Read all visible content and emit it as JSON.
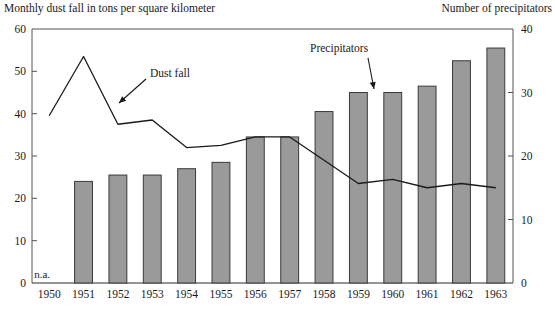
{
  "header": {
    "left_title": "Monthly dust fall in tons per square kilometer",
    "right_title": "Number of precipitators"
  },
  "annotations": {
    "dust_fall_label": "Dust fall",
    "precipitators_label": "Precipitators",
    "not_available_label": "n.a."
  },
  "axes": {
    "left_ticks": [
      "60",
      "50",
      "40",
      "30",
      "20",
      "10",
      "0"
    ],
    "right_ticks": [
      "40",
      "30",
      "20",
      "10",
      "0"
    ],
    "year_labels": [
      "1950",
      "1951",
      "1952",
      "1953",
      "1954",
      "1955",
      "1956",
      "1957",
      "1958",
      "1959",
      "1960",
      "1961",
      "1962",
      "1963"
    ]
  },
  "colors": {
    "bar_fill": "#9a9a9a",
    "bar_stroke": "#3a3a3a",
    "line": "#1a1a1a",
    "axis": "#555555"
  },
  "chart_data": {
    "type": "bar",
    "xlabel": "",
    "ylabel": "Monthly dust fall in tons per square kilometer",
    "y2label": "Number of precipitators",
    "ylim": [
      0,
      60
    ],
    "y2lim": [
      0,
      40
    ],
    "yticks": [
      0,
      10,
      20,
      30,
      40,
      50,
      60
    ],
    "y2ticks": [
      0,
      10,
      20,
      30,
      40
    ],
    "grid": false,
    "legend": "annotations",
    "categories": [
      "1950",
      "1951",
      "1952",
      "1953",
      "1954",
      "1955",
      "1956",
      "1957",
      "1958",
      "1959",
      "1960",
      "1961",
      "1962",
      "1963"
    ],
    "series": [
      {
        "name": "Precipitators",
        "type": "bar",
        "axis": "right",
        "values": [
          null,
          16,
          17,
          17,
          18,
          19,
          23,
          23,
          27,
          30,
          30,
          31,
          35,
          37
        ],
        "note_1950": "n.a."
      },
      {
        "name": "Dust fall",
        "type": "line",
        "axis": "left",
        "values": [
          39.5,
          53.5,
          37.5,
          38.5,
          32.0,
          32.5,
          34.5,
          34.5,
          29.0,
          23.5,
          24.5,
          22.5,
          23.5,
          22.5
        ]
      }
    ]
  }
}
